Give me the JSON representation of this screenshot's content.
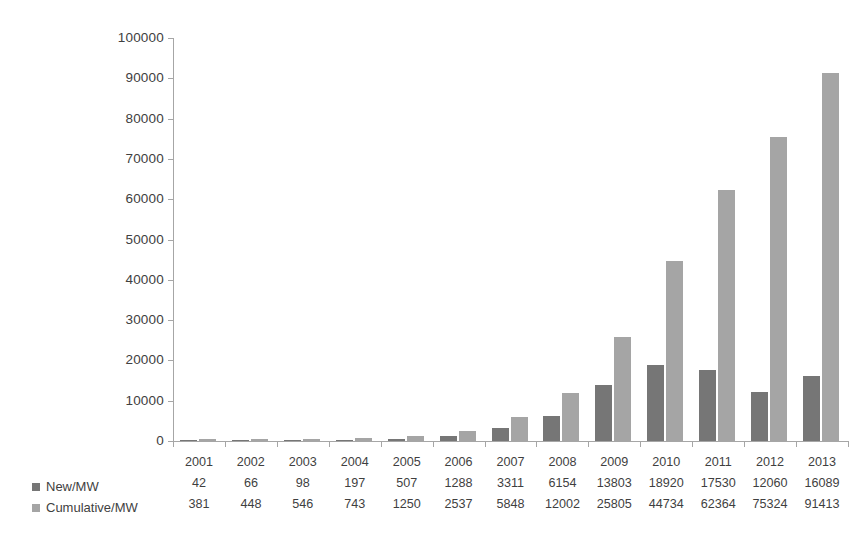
{
  "chart_data": {
    "type": "bar",
    "title": "",
    "subtitle": "",
    "xlabel": "",
    "ylabel": "",
    "grid": false,
    "legend_position": "bottom-left",
    "categories": [
      "2001",
      "2002",
      "2003",
      "2004",
      "2005",
      "2006",
      "2007",
      "2008",
      "2009",
      "2010",
      "2011",
      "2012",
      "2013"
    ],
    "ylim": [
      0,
      100000
    ],
    "ytick_labels": [
      "100000",
      "90000",
      "80000",
      "70000",
      "60000",
      "50000",
      "40000",
      "30000",
      "20000",
      "10000",
      "0"
    ],
    "ytick_values": [
      100000,
      90000,
      80000,
      70000,
      60000,
      50000,
      40000,
      30000,
      20000,
      10000,
      0
    ],
    "series": [
      {
        "name": "New/MW",
        "color": "#767676",
        "values": [
          42,
          66,
          98,
          197,
          507,
          1288,
          3311,
          6154,
          13803,
          18920,
          17530,
          12060,
          16089
        ]
      },
      {
        "name": "Cumulative/MW",
        "color": "#a5a5a5",
        "values": [
          381,
          448,
          546,
          743,
          1250,
          2537,
          5848,
          12002,
          25805,
          44734,
          62364,
          75324,
          91413
        ]
      }
    ]
  },
  "legend": {
    "items": [
      {
        "label": "New/MW",
        "color": "#767676"
      },
      {
        "label": "Cumulative/MW",
        "color": "#a5a5a5"
      }
    ]
  },
  "axis": {
    "line_color": "#a6a6a6"
  }
}
